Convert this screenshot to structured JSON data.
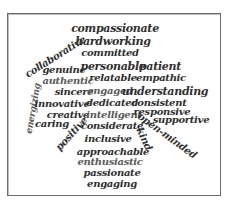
{
  "word_cloud": {
    "colors": {
      "dark": "#2e2e2e",
      "gray": "#5a5a5a",
      "border": "#6a6a6a"
    },
    "words": [
      {
        "text": "compassionate",
        "x": 115,
        "y": 28,
        "size": 11,
        "rot": 0,
        "tone": "dark"
      },
      {
        "text": "hardworking",
        "x": 113,
        "y": 41,
        "size": 11,
        "rot": 0,
        "tone": "dark"
      },
      {
        "text": "collaborative",
        "x": 55,
        "y": 57,
        "size": 10,
        "rot": -32,
        "tone": "dark"
      },
      {
        "text": "committed",
        "x": 110,
        "y": 53,
        "size": 10,
        "rot": 0,
        "tone": "dark"
      },
      {
        "text": "genuine",
        "x": 64,
        "y": 70,
        "size": 10,
        "rot": 0,
        "tone": "dark"
      },
      {
        "text": "personable",
        "x": 113,
        "y": 66,
        "size": 11,
        "rot": 0,
        "tone": "dark"
      },
      {
        "text": "patient",
        "x": 160,
        "y": 66,
        "size": 11,
        "rot": 0,
        "tone": "dark"
      },
      {
        "text": "relatable",
        "x": 113,
        "y": 78,
        "size": 10,
        "rot": 0,
        "tone": "dark"
      },
      {
        "text": "empathic",
        "x": 161,
        "y": 78,
        "size": 10,
        "rot": 0,
        "tone": "dark"
      },
      {
        "text": "authentic",
        "x": 68,
        "y": 81,
        "size": 10,
        "rot": 0,
        "tone": "gray"
      },
      {
        "text": "sincere",
        "x": 74,
        "y": 92,
        "size": 10,
        "rot": 0,
        "tone": "dark"
      },
      {
        "text": "engaged",
        "x": 110,
        "y": 91,
        "size": 10,
        "rot": 0,
        "tone": "gray"
      },
      {
        "text": "understanding",
        "x": 165,
        "y": 91,
        "size": 11,
        "rot": 0,
        "tone": "dark"
      },
      {
        "text": "energizing",
        "x": 33,
        "y": 108,
        "size": 9,
        "rot": -80,
        "tone": "gray"
      },
      {
        "text": "innovative",
        "x": 62,
        "y": 104,
        "size": 10,
        "rot": 0,
        "tone": "dark"
      },
      {
        "text": "dedicated",
        "x": 112,
        "y": 103,
        "size": 10,
        "rot": 0,
        "tone": "dark"
      },
      {
        "text": "consistent",
        "x": 159,
        "y": 103,
        "size": 10,
        "rot": 0,
        "tone": "dark"
      },
      {
        "text": "creative",
        "x": 68,
        "y": 115,
        "size": 10,
        "rot": 0,
        "tone": "dark"
      },
      {
        "text": "intelligent",
        "x": 114,
        "y": 115,
        "size": 10,
        "rot": 0,
        "tone": "gray"
      },
      {
        "text": "responsive",
        "x": 162,
        "y": 112,
        "size": 10,
        "rot": 0,
        "tone": "dark"
      },
      {
        "text": "supportive",
        "x": 181,
        "y": 120,
        "size": 10,
        "rot": 0,
        "tone": "dark"
      },
      {
        "text": "caring",
        "x": 52,
        "y": 124,
        "size": 10,
        "rot": 0,
        "tone": "dark"
      },
      {
        "text": "positive",
        "x": 72,
        "y": 134,
        "size": 10,
        "rot": -48,
        "tone": "dark"
      },
      {
        "text": "considerate",
        "x": 112,
        "y": 126,
        "size": 10,
        "rot": 0,
        "tone": "dark"
      },
      {
        "text": "open-minded",
        "x": 167,
        "y": 136,
        "size": 10,
        "rot": 36,
        "tone": "dark"
      },
      {
        "text": "kind",
        "x": 144,
        "y": 139,
        "size": 10,
        "rot": 65,
        "tone": "dark"
      },
      {
        "text": "inclusive",
        "x": 108,
        "y": 139,
        "size": 10,
        "rot": 0,
        "tone": "dark"
      },
      {
        "text": "approachable",
        "x": 113,
        "y": 152,
        "size": 10,
        "rot": 0,
        "tone": "dark"
      },
      {
        "text": "enthusiastic",
        "x": 110,
        "y": 162,
        "size": 10,
        "rot": 0,
        "tone": "gray"
      },
      {
        "text": "passionate",
        "x": 112,
        "y": 173,
        "size": 10,
        "rot": 0,
        "tone": "dark"
      },
      {
        "text": "engaging",
        "x": 112,
        "y": 184,
        "size": 10,
        "rot": 0,
        "tone": "dark"
      }
    ]
  }
}
